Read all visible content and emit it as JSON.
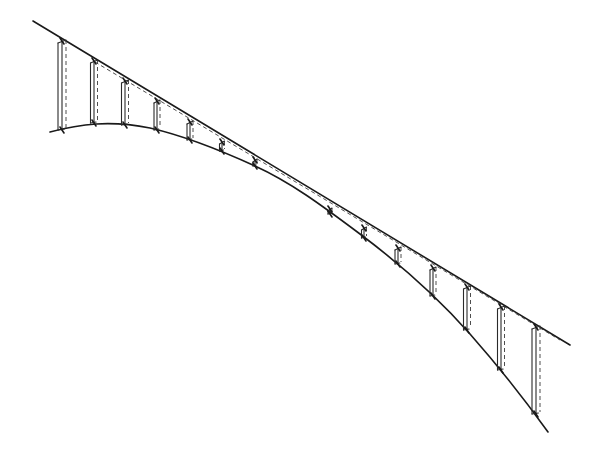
{
  "drawing": {
    "description": "Hand-drawn sketch of a tensioned structure: a straight upper line and a curved lower line connected by vertical struts, with dashed construction lines",
    "stroke_color": "#1a1a1a",
    "background": "#ffffff",
    "straight_line": {
      "x1": 33,
      "y1": 21,
      "x2": 570,
      "y2": 345
    },
    "dashed_line": {
      "x1": 95,
      "y1": 62,
      "x2": 560,
      "y2": 340
    },
    "curve_path": "M50,132 C80,124 110,120 150,128 C185,136 220,150 255,166 C290,182 320,204 360,234 C400,264 440,300 470,334 C500,368 525,400 548,432",
    "struts_left": [
      {
        "x": 62,
        "top": 41,
        "bottom": 130,
        "width": 8
      },
      {
        "x": 94,
        "top": 61,
        "bottom": 123,
        "width": 7
      },
      {
        "x": 125,
        "top": 81,
        "bottom": 125,
        "width": 7
      },
      {
        "x": 157,
        "top": 101,
        "bottom": 130,
        "width": 6
      },
      {
        "x": 190,
        "top": 122,
        "bottom": 140,
        "width": 6
      },
      {
        "x": 222,
        "top": 142,
        "bottom": 151,
        "width": 5
      },
      {
        "x": 255,
        "top": 160,
        "bottom": 166,
        "width": 4
      }
    ],
    "struts_right": [
      {
        "x": 330,
        "top": 209,
        "bottom": 214,
        "width": 4
      },
      {
        "x": 364,
        "top": 228,
        "bottom": 238,
        "width": 5
      },
      {
        "x": 398,
        "top": 248,
        "bottom": 264,
        "width": 6
      },
      {
        "x": 433,
        "top": 268,
        "bottom": 296,
        "width": 6
      },
      {
        "x": 467,
        "top": 287,
        "bottom": 330,
        "width": 7
      },
      {
        "x": 501,
        "top": 307,
        "bottom": 370,
        "width": 7
      },
      {
        "x": 536,
        "top": 327,
        "bottom": 414,
        "width": 8
      }
    ]
  }
}
